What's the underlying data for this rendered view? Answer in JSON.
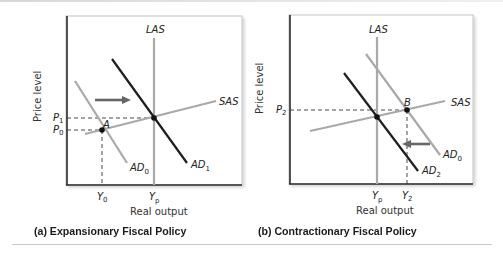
{
  "panels": [
    {
      "id": "a",
      "caption": "(a)  Expansionary Fiscal Policy",
      "y_axis_label": "Price level",
      "x_axis_label": "Real output",
      "curves": {
        "las": "LAS",
        "sas": "SAS",
        "ad_initial": "AD",
        "ad_initial_sub": "0",
        "ad_new": "AD",
        "ad_new_sub": "1"
      },
      "point_label": "A",
      "price_ticks": [
        {
          "label": "P",
          "sub": "1"
        },
        {
          "label": "P",
          "sub": "0"
        }
      ],
      "output_ticks": [
        {
          "label": "Y",
          "sub": "0"
        },
        {
          "label": "Y",
          "sub": "p"
        }
      ],
      "shift_direction": "right"
    },
    {
      "id": "b",
      "caption": "(b)  Contractionary Fiscal Policy",
      "y_axis_label": "Price level",
      "x_axis_label": "Real output",
      "curves": {
        "las": "LAS",
        "sas": "SAS",
        "ad_initial": "AD",
        "ad_initial_sub": "0",
        "ad_new": "AD",
        "ad_new_sub": "2"
      },
      "point_label": "B",
      "price_ticks": [
        {
          "label": "P",
          "sub": "2"
        }
      ],
      "output_ticks": [
        {
          "label": "Y",
          "sub": "p"
        },
        {
          "label": "Y",
          "sub": "2"
        }
      ],
      "shift_direction": "left"
    }
  ],
  "colors": {
    "axis": "#2a2a2a",
    "frame": "#c4c4c4",
    "light_curve": "#a9a9a9",
    "dark_curve": "#1e1e1e",
    "arrow": "#666666"
  }
}
